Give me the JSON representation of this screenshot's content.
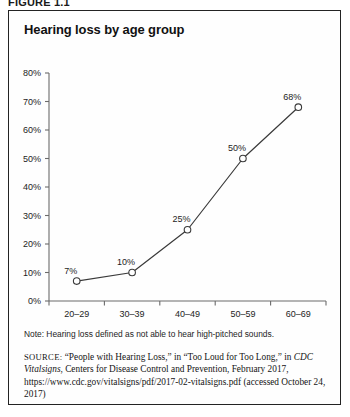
{
  "figure": {
    "label": "FIGURE 1.1",
    "title": "Hearing loss by age group",
    "note": "Note: Hearing loss defined as not able to hear high-pitched sounds.",
    "source": {
      "label": "SOURCE:",
      "text_part1": " “People with Hearing Loss,” in “Too Loud for Too Long,” in ",
      "italic_title": "CDC Vitalsigns",
      "text_part2": ", Centers for Disease Control and Prevention, February 2017, https://www.cdc.gov/vitalsigns/pdf/2017-02-vitalsigns.pdf (accessed October 24, 2017)"
    }
  },
  "chart_data": {
    "type": "line",
    "title": "Hearing loss by age group",
    "xlabel": "",
    "ylabel": "",
    "categories": [
      "20–29\nyears",
      "30–39\nyears",
      "40–49\nyears",
      "50–59\nyears",
      "60–69\nyears"
    ],
    "category_lines": [
      {
        "range": "20–29",
        "unit": "years"
      },
      {
        "range": "30–39",
        "unit": "years"
      },
      {
        "range": "40–49",
        "unit": "years"
      },
      {
        "range": "50–59",
        "unit": "years"
      },
      {
        "range": "60–69",
        "unit": "years"
      }
    ],
    "values": [
      7,
      10,
      25,
      50,
      68
    ],
    "point_labels": [
      "7%",
      "10%",
      "25%",
      "50%",
      "68%"
    ],
    "ylim": [
      0,
      80
    ],
    "ytick_values": [
      0,
      10,
      20,
      30,
      40,
      50,
      60,
      70,
      80
    ],
    "ytick_labels": [
      "0%",
      "10%",
      "20%",
      "30%",
      "40%",
      "50%",
      "60%",
      "70%",
      "80%"
    ],
    "grid": false,
    "legend": false,
    "marker": "open-circle",
    "line_color": "#3a3a3a",
    "marker_fill": "#ffffff",
    "axis_color": "#6b6b6b"
  }
}
